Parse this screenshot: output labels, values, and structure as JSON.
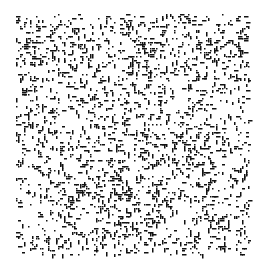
{
  "image": {
    "description": "Black speckle / stipple noise texture on white background",
    "background_color": "#ffffff",
    "speck_color": "#111111",
    "region": {
      "x": 16,
      "y": 14,
      "width": 234,
      "height": 242
    },
    "density_zones": [
      {
        "x": 20,
        "y": 40,
        "w": 40,
        "h": 25,
        "weight": 1.8
      },
      {
        "x": 135,
        "y": 40,
        "w": 100,
        "h": 40,
        "weight": 1.6
      },
      {
        "x": 140,
        "y": 130,
        "w": 60,
        "h": 40,
        "weight": 1.7
      },
      {
        "x": 80,
        "y": 160,
        "w": 50,
        "h": 40,
        "weight": 1.5
      },
      {
        "x": 100,
        "y": 200,
        "w": 40,
        "h": 40,
        "weight": 1.6
      },
      {
        "x": 185,
        "y": 215,
        "w": 40,
        "h": 30,
        "weight": 1.4
      }
    ],
    "seed": 1337,
    "base_density": 0.13
  }
}
